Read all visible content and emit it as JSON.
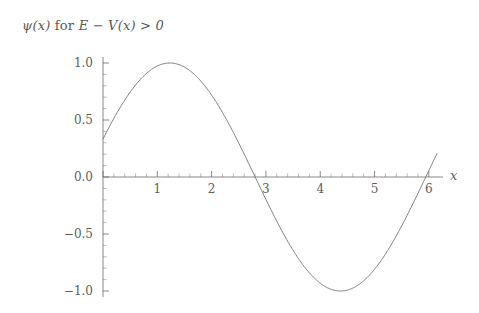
{
  "figure": {
    "background": "#ffffff",
    "title_text": {
      "symbol": "ψ(x)",
      "for_word": "for",
      "expression": "E − V(x) > 0"
    },
    "title_full": "ψ(x) for E − V(x) > 0"
  },
  "chart_data": {
    "type": "line",
    "title": "ψ(x) for E − V(x) > 0",
    "xlabel": "x",
    "ylabel": "",
    "xlim": [
      0,
      6.15
    ],
    "ylim": [
      -1.12,
      1.12
    ],
    "grid": false,
    "legend": null,
    "line_color": "#707070",
    "line_width": 0.9,
    "x_ticks": [
      0,
      1,
      2,
      3,
      4,
      5,
      6
    ],
    "x_tick_labels": [
      "",
      "1",
      "2",
      "3",
      "4",
      "5",
      "6"
    ],
    "x_minor_step": 0.2,
    "y_ticks": [
      -1.0,
      -0.5,
      0.0,
      0.5,
      1.0
    ],
    "y_tick_labels": [
      "−1.0",
      "−0.5",
      "0.0",
      "0.5",
      "1.0"
    ],
    "y_minor_step": 0.1,
    "function": "sin(x + 0.34)",
    "phase": 0.34,
    "amplitude": 1.0,
    "series": [
      {
        "name": "ψ(x)",
        "x": [
          0.0,
          0.1,
          0.2,
          0.3,
          0.4,
          0.5,
          0.6,
          0.7,
          0.8,
          0.9,
          1.0,
          1.1,
          1.2,
          1.23,
          1.3,
          1.4,
          1.5,
          1.6,
          1.7,
          1.8,
          1.9,
          2.0,
          2.1,
          2.2,
          2.3,
          2.4,
          2.5,
          2.6,
          2.7,
          2.8,
          2.8016,
          2.9,
          3.0,
          3.1,
          3.2,
          3.3,
          3.4,
          3.5,
          3.6,
          3.7,
          3.8,
          3.9,
          4.0,
          4.1,
          4.2,
          4.3,
          4.4,
          4.4024,
          4.5,
          4.6,
          4.7,
          4.8,
          4.9,
          5.0,
          5.1,
          5.2,
          5.3,
          5.4,
          5.5,
          5.6,
          5.7,
          5.8,
          5.9,
          5.9432,
          6.0,
          6.1,
          6.15
        ],
        "y": [
          0.3335,
          0.4251,
          0.512,
          0.5929,
          0.6669,
          0.7329,
          0.7901,
          0.8377,
          0.8752,
          0.9021,
          0.918,
          0.9227,
          0.9162,
          0.913,
          0.8987,
          0.8703,
          0.8314,
          0.7825,
          0.7241,
          0.657,
          0.5822,
          0.5006,
          0.4133,
          0.3214,
          0.2263,
          0.1291,
          0.0312,
          -0.0661,
          -0.1619,
          -0.2549,
          -0.2564,
          -0.3441,
          -0.4286,
          -0.5077,
          -0.5805,
          -0.6461,
          -0.7036,
          -0.7523,
          -0.7915,
          -0.8209,
          -0.84,
          -0.8486,
          -0.8466,
          -0.8341,
          -0.8113,
          -0.7785,
          -0.736,
          -0.7349,
          -0.6847,
          -0.6251,
          -0.558,
          -0.4842,
          -0.4046,
          -0.3202,
          -0.2322,
          -0.1415,
          -0.0495,
          0.0428,
          0.1342,
          0.2237,
          0.3101,
          0.3925,
          0.4699,
          0.5017,
          0.5413,
          0.606,
          0.6367
        ],
        "notes": {
          "value_at_x0": 0.33,
          "maximum": {
            "x": 1.23,
            "y": 1.0
          },
          "zero_crossing_down": 2.8,
          "minimum": {
            "x": 4.37,
            "y": -1.0
          },
          "zero_crossing_up": 5.94
        }
      }
    ]
  },
  "axes": {
    "x_axis_label": "x",
    "y_axis_label": ""
  }
}
